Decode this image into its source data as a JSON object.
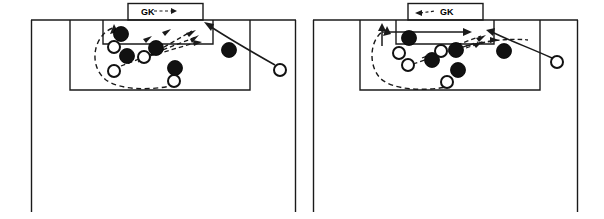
{
  "figure": {
    "type": "soccer-tactics-diagram-pair",
    "panel_count": 2,
    "background_color": "#ffffff",
    "line_color": "#1a1a1a"
  },
  "panels": [
    {
      "id": "panel-left",
      "name": "left-diagram",
      "gk_label": "GK",
      "field": {
        "left_touchline_x": 31,
        "right_touchline_x": 296,
        "goal_line_y": 20,
        "bottom_y": 212,
        "penalty_area": {
          "x": 70,
          "y": 20,
          "w": 180,
          "h": 70
        },
        "six_yard_box": {
          "x": 103,
          "y": 20,
          "w": 110,
          "h": 24
        },
        "goal_box": {
          "x": 128,
          "y": 3,
          "w": 75,
          "h": 17
        }
      },
      "players": {
        "defenders_label": "filled-circle",
        "attackers_label": "open-circle",
        "filled": [
          {
            "cx": 121,
            "cy": 34,
            "r": 7.5
          },
          {
            "cx": 156,
            "cy": 48,
            "r": 7.5
          },
          {
            "cx": 127,
            "cy": 56,
            "r": 7.5
          },
          {
            "cx": 175,
            "cy": 68,
            "r": 7.5
          },
          {
            "cx": 229,
            "cy": 50,
            "r": 7.5
          },
          {
            "cx": 169,
            "cy": 61,
            "r": 2
          }
        ],
        "open": [
          {
            "cx": 114,
            "cy": 47,
            "r": 6.5
          },
          {
            "cx": 144,
            "cy": 57,
            "r": 6.5
          },
          {
            "cx": 114,
            "cy": 71,
            "r": 6.5
          },
          {
            "cx": 174,
            "cy": 81,
            "r": 6.5
          },
          {
            "cx": 280,
            "cy": 70,
            "r": 6.5
          }
        ]
      },
      "annotations": {
        "gk_arrow_direction": "right",
        "ball_run_arrow": "solid-curve-from-right-winger-to-near-post",
        "dashed_loop": "large-dashed-arc-around-left-of-penalty-area",
        "dashed_passes": 3
      }
    },
    {
      "id": "panel-right",
      "name": "right-diagram",
      "gk_label": "GK",
      "field": {
        "left_touchline_x": 313,
        "right_touchline_x": 578,
        "goal_line_y": 20,
        "bottom_y": 212,
        "penalty_area": {
          "x": 360,
          "y": 20,
          "w": 180,
          "h": 70
        },
        "six_yard_box": {
          "x": 396,
          "y": 20,
          "w": 98,
          "h": 24
        },
        "goal_box": {
          "x": 408,
          "y": 3,
          "w": 75,
          "h": 17
        }
      },
      "players": {
        "defenders_label": "filled-circle",
        "attackers_label": "open-circle",
        "filled": [
          {
            "cx": 409,
            "cy": 38,
            "r": 7.5
          },
          {
            "cx": 456,
            "cy": 50,
            "r": 7.5
          },
          {
            "cx": 432,
            "cy": 60,
            "r": 7.5
          },
          {
            "cx": 458,
            "cy": 70,
            "r": 7.5
          },
          {
            "cx": 504,
            "cy": 51,
            "r": 7.5
          }
        ],
        "open": [
          {
            "cx": 399,
            "cy": 53,
            "r": 6.5
          },
          {
            "cx": 408,
            "cy": 65,
            "r": 6.5
          },
          {
            "cx": 441,
            "cy": 51,
            "r": 6.5
          },
          {
            "cx": 447,
            "cy": 82,
            "r": 6.5
          },
          {
            "cx": 557,
            "cy": 62,
            "r": 6.5
          }
        ]
      },
      "annotations": {
        "gk_arrow_direction": "left",
        "ball_run_arrow": "solid-curve-from-right-winger-to-near-post",
        "dashed_loop": "large-dashed-arc-around-left-of-penalty-area",
        "dashed_passes": 3,
        "solid_long_arrow": "horizontal-arrow-across-six-yard-box"
      }
    }
  ]
}
